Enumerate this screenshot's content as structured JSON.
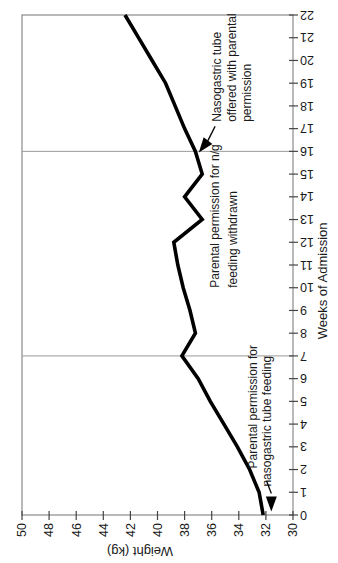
{
  "figure": {
    "description_label": "Weight over weeks of admission line chart (rotated scan)"
  },
  "colors": {
    "line": "#000000",
    "axis": "#444444",
    "border": "#8a8a8a",
    "grid": "#9a9a9a",
    "text": "#1a1a1a",
    "background": "#ffffff"
  },
  "chart_data": {
    "type": "line",
    "title": "",
    "xlabel": "Weeks of Admission",
    "ylabel": "Weight (kg)",
    "xlim": [
      0,
      22
    ],
    "ylim": [
      30,
      50
    ],
    "x_ticks": [
      0,
      1,
      2,
      3,
      4,
      5,
      6,
      7,
      8,
      9,
      10,
      11,
      12,
      13,
      14,
      15,
      16,
      17,
      18,
      19,
      20,
      21,
      22
    ],
    "y_ticks": [
      30,
      32,
      34,
      36,
      38,
      40,
      42,
      44,
      46,
      48,
      50
    ],
    "grid": "vertical-event-lines-only",
    "gridlines_x": [
      7,
      16
    ],
    "legend": false,
    "rotation_in_screenshot_deg": -90,
    "x": [
      0,
      1,
      2,
      3,
      4,
      5,
      6,
      7,
      8,
      9,
      10,
      11,
      12,
      13,
      14,
      15,
      16,
      17,
      18,
      19,
      20,
      21,
      22
    ],
    "series": [
      {
        "name": "Weight (kg)",
        "values": [
          32.2,
          32.5,
          33.2,
          34.1,
          35.1,
          36.1,
          37.0,
          38.2,
          37.2,
          37.6,
          38.1,
          38.5,
          38.8,
          36.7,
          38.0,
          36.7,
          37.2,
          38.0,
          38.7,
          39.4,
          40.4,
          41.4,
          42.4
        ]
      }
    ],
    "annotations": [
      {
        "id": "permission-given",
        "lines": [
          {
            "text": "Parental permission for",
            "at": [
              2.05,
              33.0
            ]
          },
          {
            "text": "nasogastric tube feeding",
            "at": [
              1.25,
              31.9
            ]
          }
        ],
        "leader_from": [
          1.5,
          31.95
        ],
        "arrow_tail": [
          0.95,
          31.6
        ],
        "arrow_tip": [
          0.15,
          31.6
        ]
      },
      {
        "id": "permission-withdrawn",
        "lines": [
          {
            "text": "Parental permission for n/g",
            "at": [
              10.0,
              35.8
            ]
          },
          {
            "text": "feeding withdrawn",
            "at": [
              10.0,
              34.45
            ]
          }
        ]
      },
      {
        "id": "tube-offered",
        "lines": [
          {
            "text": "Nasogastric tube",
            "at": [
              17.3,
              35.6
            ]
          },
          {
            "text": "offered with parental",
            "at": [
              17.3,
              34.5
            ]
          },
          {
            "text": "permission",
            "at": [
              17.3,
              33.4
            ]
          }
        ],
        "leader_from": [
          17.1,
          35.75
        ],
        "arrow_tail": [
          16.45,
          36.3
        ],
        "arrow_tip": [
          15.95,
          36.95
        ]
      }
    ]
  }
}
